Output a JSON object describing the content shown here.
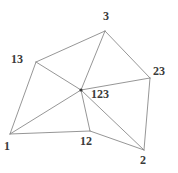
{
  "figure": {
    "background_color": "#ffffff",
    "edge_color": "#8a8a8a",
    "label_color": "#3a3a3a",
    "width": 178,
    "height": 173
  },
  "labels": {
    "v3": "3",
    "v13": "13",
    "v23": "23",
    "v123": "123",
    "v1": "1",
    "v12": "12",
    "v2": "2"
  },
  "chart_data": {
    "type": "diagram",
    "nodes": [
      {
        "id": "3",
        "label": "3",
        "x": 105,
        "y": 31,
        "label_x": 103,
        "label_y": 10,
        "marked": false
      },
      {
        "id": "13",
        "label": "13",
        "x": 36,
        "y": 62,
        "label_x": 11,
        "label_y": 53,
        "marked": false
      },
      {
        "id": "23",
        "label": "23",
        "x": 150,
        "y": 78,
        "label_x": 153,
        "label_y": 65,
        "marked": false
      },
      {
        "id": "123",
        "label": "123",
        "x": 81,
        "y": 90,
        "label_x": 91,
        "label_y": 88,
        "marked": true
      },
      {
        "id": "1",
        "label": "1",
        "x": 10,
        "y": 134,
        "label_x": 4,
        "label_y": 140,
        "marked": false
      },
      {
        "id": "12",
        "label": "12",
        "x": 90,
        "y": 131,
        "label_x": 80,
        "label_y": 135,
        "marked": false
      },
      {
        "id": "2",
        "label": "2",
        "x": 144,
        "y": 150,
        "label_x": 140,
        "label_y": 154,
        "marked": false
      }
    ],
    "edges": [
      {
        "from": "13",
        "to": "3"
      },
      {
        "from": "3",
        "to": "23"
      },
      {
        "from": "13",
        "to": "1"
      },
      {
        "from": "1",
        "to": "12"
      },
      {
        "from": "12",
        "to": "2"
      },
      {
        "from": "2",
        "to": "23"
      },
      {
        "from": "13",
        "to": "123"
      },
      {
        "from": "3",
        "to": "123"
      },
      {
        "from": "23",
        "to": "123"
      },
      {
        "from": "1",
        "to": "123"
      },
      {
        "from": "12",
        "to": "123"
      },
      {
        "from": "2",
        "to": "123"
      }
    ]
  }
}
